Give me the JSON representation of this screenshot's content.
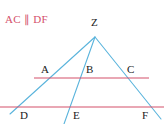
{
  "figure": {
    "title_note": "AC ∥ DF",
    "background_color": "#ffffff",
    "ray_color": "#5ab4dc",
    "transversal_color": "#d4516b",
    "label_color": "#1a1a1a",
    "width": 164,
    "height": 124
  },
  "labels": {
    "apex": "Z",
    "upper_left": "A",
    "upper_middle": "B",
    "upper_right": "C",
    "lower_left": "D",
    "lower_middle": "E",
    "lower_right": "F"
  },
  "geometry": {
    "apex_point": {
      "name": "Z",
      "x": 95,
      "y": 37
    },
    "upper_line": {
      "name": "AC",
      "y": 78,
      "x_start": 34,
      "x_end": 149,
      "points": [
        {
          "name": "A",
          "x": 52,
          "y": 78
        },
        {
          "name": "B",
          "x": 84,
          "y": 78
        },
        {
          "name": "C",
          "x": 126,
          "y": 78
        }
      ]
    },
    "lower_line": {
      "name": "DF",
      "y": 107,
      "x_start": 0,
      "x_end": 164,
      "points": [
        {
          "name": "D",
          "x": 18,
          "y": 107
        },
        {
          "name": "E",
          "x": 71,
          "y": 107
        },
        {
          "name": "F",
          "x": 153,
          "y": 107
        }
      ]
    },
    "rays": [
      {
        "name": "ray-ZAD",
        "x1": 95,
        "y1": 37,
        "x2": 10,
        "y2": 114
      },
      {
        "name": "ray-ZBE",
        "x1": 95,
        "y1": 37,
        "x2": 64,
        "y2": 124
      },
      {
        "name": "ray-ZCF",
        "x1": 95,
        "y1": 37,
        "x2": 161,
        "y2": 119
      }
    ]
  },
  "label_positions": {
    "Z": {
      "x": 91,
      "y": 17
    },
    "A": {
      "x": 41,
      "y": 64
    },
    "B": {
      "x": 86,
      "y": 64
    },
    "C": {
      "x": 127,
      "y": 64
    },
    "D": {
      "x": 20,
      "y": 110
    },
    "E": {
      "x": 73,
      "y": 110
    },
    "F": {
      "x": 142,
      "y": 110
    }
  }
}
